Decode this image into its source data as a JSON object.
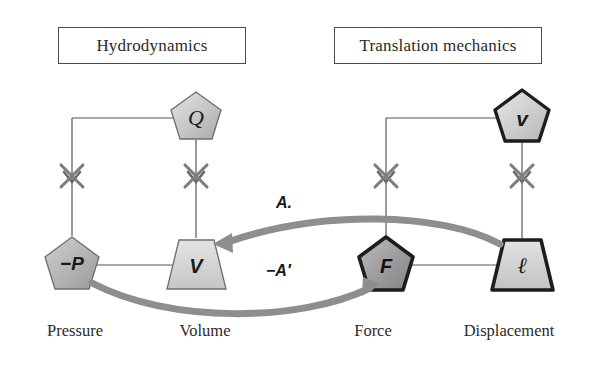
{
  "figure": {
    "type": "analogy-bond-diagram",
    "background": "#ffffff"
  },
  "domains": [
    {
      "id": "hydrodynamics",
      "label": "Hydrodynamics"
    },
    {
      "id": "translation_mechanics",
      "label": "Translation mechanics"
    }
  ],
  "nodes": [
    {
      "id": "Q",
      "symbol": "Q",
      "shape": "pentagon",
      "border": "thin",
      "fill": "#c9c9c9",
      "domain": "hydrodynamics",
      "role": "flow-top"
    },
    {
      "id": "P",
      "symbol": "−P",
      "shape": "pentagon",
      "border": "thin",
      "fill": "#b8b8b8",
      "domain": "hydrodynamics",
      "role": "effort",
      "bottom_label": "Pressure"
    },
    {
      "id": "V",
      "symbol": "V",
      "shape": "trapezoid",
      "border": "thin",
      "fill": "#d2d2d2",
      "domain": "hydrodynamics",
      "role": "displacement",
      "bottom_label": "Volume"
    },
    {
      "id": "v",
      "symbol": "v",
      "shape": "pentagon",
      "border": "thick",
      "fill": "#d0d0d0",
      "domain": "translation_mechanics",
      "role": "flow-top"
    },
    {
      "id": "F",
      "symbol": "F",
      "shape": "pentagon",
      "border": "thick",
      "fill": "#9e9e9e",
      "domain": "translation_mechanics",
      "role": "effort",
      "bottom_label": "Force"
    },
    {
      "id": "l",
      "symbol": "ℓ",
      "shape": "trapezoid",
      "border": "thick",
      "fill": "#cfcfcf",
      "domain": "translation_mechanics",
      "role": "displacement",
      "bottom_label": "Displacement"
    }
  ],
  "bottom_labels": {
    "pressure": "Pressure",
    "volume": "Volume",
    "force": "Force",
    "displacement": "Displacement"
  },
  "coupling_arrows": [
    {
      "id": "A",
      "label": "A.",
      "from": "l",
      "to": "V",
      "direction": "right-to-left",
      "color": "#8c8c8c"
    },
    {
      "id": "negAprime",
      "label": "−A′",
      "from": "P",
      "to": "F",
      "direction": "left-to-right",
      "color": "#8c8c8c"
    }
  ],
  "markers": {
    "cross_count": 4,
    "cross_color": "#7d7d7d",
    "note": "X marks on the four vertical bonds"
  },
  "line_color": "#555555"
}
